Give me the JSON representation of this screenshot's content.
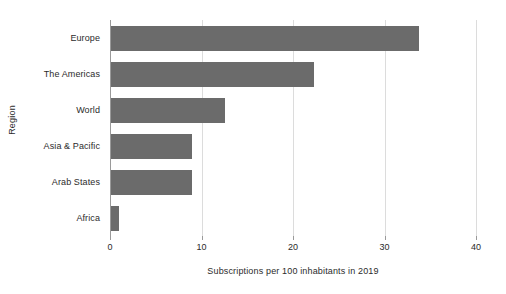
{
  "chart_data": {
    "type": "bar",
    "orientation": "horizontal",
    "title": "",
    "xlabel": "Subscriptions per 100 inhabitants in 2019",
    "ylabel": "Region",
    "categories": [
      "Europe",
      "The Americas",
      "World",
      "Asia & Pacific",
      "Arab States",
      "Africa"
    ],
    "values": [
      33.7,
      22.2,
      12.5,
      8.9,
      8.9,
      0.9
    ],
    "series": [
      {
        "name": "Subscriptions per 100 inhabitants in 2019",
        "values": [
          33.7,
          22.2,
          12.5,
          8.9,
          8.9,
          0.9
        ]
      }
    ],
    "xlim": [
      0,
      40
    ],
    "xticks": [
      0,
      10,
      20,
      30,
      40
    ],
    "xtick_labels": [
      "0",
      "10",
      "20",
      "30",
      "40"
    ],
    "grid": true,
    "grid_axis": "x",
    "legend": false,
    "bar_color": "#6b6b6b",
    "grid_color": "#dcdcdc",
    "axis_color": "#9a9a9a",
    "background_color": "#ffffff",
    "text_color": "#2b2b2b"
  }
}
